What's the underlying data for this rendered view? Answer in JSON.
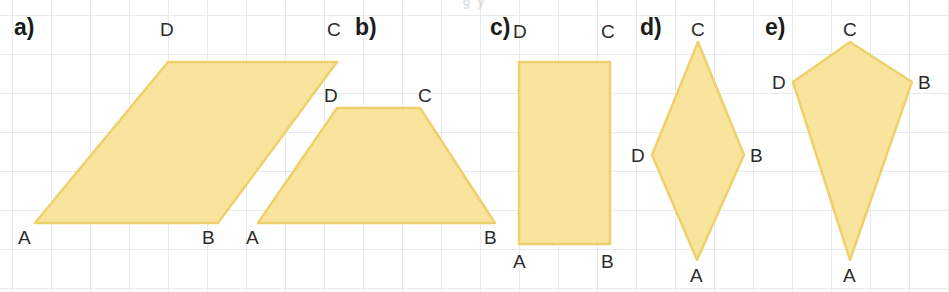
{
  "figure": {
    "width": 949,
    "height": 292,
    "background_color": "#ffffff",
    "grid_color": "#e7ebf1",
    "grid_spacing": 39,
    "shape_fill": "#f8e49c",
    "shape_stroke": "#eed16c",
    "label_color": "#1b1b1b",
    "vertex_label_color": "#2b2b2b",
    "top_clipped_text": "g    y"
  },
  "sections": [
    {
      "id": "a",
      "label": "a)",
      "label_x": 14,
      "label_y": 16,
      "shape_name": "parallelogram",
      "points": "35,223 168,62 337,62 218,223",
      "vertices": [
        {
          "name": "A",
          "x": 18,
          "y": 228
        },
        {
          "name": "B",
          "x": 202,
          "y": 228
        },
        {
          "name": "C",
          "x": 327,
          "y": 20
        },
        {
          "name": "D",
          "x": 160,
          "y": 20
        }
      ]
    },
    {
      "id": "b",
      "label": "b)",
      "label_x": 355,
      "label_y": 16,
      "shape_name": "trapezoid",
      "points": "258,223 337,108 420,108 495,223",
      "vertices": [
        {
          "name": "A",
          "x": 246,
          "y": 228
        },
        {
          "name": "B",
          "x": 484,
          "y": 228
        },
        {
          "name": "C",
          "x": 418,
          "y": 86
        },
        {
          "name": "D",
          "x": 324,
          "y": 86
        }
      ]
    },
    {
      "id": "c",
      "label": "c)",
      "label_x": 490,
      "label_y": 16,
      "shape_name": "rectangle",
      "points": "519,62 610,62 610,244 519,244",
      "vertices": [
        {
          "name": "A",
          "x": 513,
          "y": 252
        },
        {
          "name": "B",
          "x": 601,
          "y": 252
        },
        {
          "name": "C",
          "x": 601,
          "y": 22
        },
        {
          "name": "D",
          "x": 513,
          "y": 22
        }
      ]
    },
    {
      "id": "d",
      "label": "d)",
      "label_x": 640,
      "label_y": 16,
      "shape_name": "rhombus",
      "points": "697,260 744,155 698,42 652,155",
      "vertices": [
        {
          "name": "A",
          "x": 690,
          "y": 266
        },
        {
          "name": "B",
          "x": 750,
          "y": 146
        },
        {
          "name": "C",
          "x": 691,
          "y": 20
        },
        {
          "name": "D",
          "x": 631,
          "y": 146
        }
      ]
    },
    {
      "id": "e",
      "label": "e)",
      "label_x": 765,
      "label_y": 16,
      "shape_name": "kite",
      "points": "850,260 912,82 850,42 793,82",
      "vertices": [
        {
          "name": "A",
          "x": 843,
          "y": 266
        },
        {
          "name": "B",
          "x": 918,
          "y": 73
        },
        {
          "name": "C",
          "x": 843,
          "y": 20
        },
        {
          "name": "D",
          "x": 772,
          "y": 73
        }
      ]
    }
  ]
}
